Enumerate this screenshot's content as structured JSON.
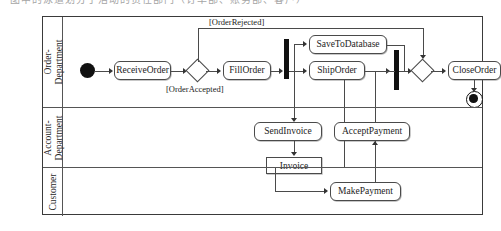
{
  "top_caption": "图中的泳道划分了活动的责任部门（订单部、账务部、客户）",
  "diagram": {
    "type": "uml-activity-diagram",
    "lanes": [
      {
        "id": "order-department",
        "label_lines": [
          "Order-",
          "Department"
        ]
      },
      {
        "id": "account-department",
        "label_lines": [
          "Account-",
          "Department"
        ]
      },
      {
        "id": "customer",
        "label_lines": [
          "Customer"
        ]
      }
    ],
    "nodes": {
      "initial": {
        "kind": "initial-node",
        "lane": "order-department"
      },
      "receive_order": {
        "kind": "action",
        "label": "ReceiveOrder",
        "lane": "order-department"
      },
      "decision": {
        "kind": "decision-node",
        "lane": "order-department"
      },
      "fill_order": {
        "kind": "action",
        "label": "FillOrder",
        "lane": "order-department"
      },
      "fork": {
        "kind": "fork-node",
        "lane": "order-department"
      },
      "save_to_database": {
        "kind": "action",
        "label": "SaveToDatabase",
        "lane": "order-department"
      },
      "ship_order": {
        "kind": "action",
        "label": "ShipOrder",
        "lane": "order-department"
      },
      "join": {
        "kind": "join-node",
        "lane": "order-department"
      },
      "merge": {
        "kind": "merge-node",
        "lane": "order-department"
      },
      "close_order": {
        "kind": "action",
        "label": "CloseOrder",
        "lane": "order-department"
      },
      "final": {
        "kind": "final-node",
        "lane": "order-department"
      },
      "send_invoice": {
        "kind": "action",
        "label": "SendInvoice",
        "lane": "account-department"
      },
      "accept_payment": {
        "kind": "action",
        "label": "AcceptPayment",
        "lane": "account-department"
      },
      "invoice": {
        "kind": "object-node",
        "label": "Invoice",
        "lane": "account-department"
      },
      "make_payment": {
        "kind": "action",
        "label": "MakePayment",
        "lane": "customer"
      }
    },
    "guards": {
      "rejected": "[OrderRejected]",
      "accepted": "[OrderAccepted]"
    },
    "colors": {
      "line": "#4a4a4a",
      "fill": "#ffffff",
      "solid": "#111111",
      "frame": "#3a3a3a"
    }
  }
}
